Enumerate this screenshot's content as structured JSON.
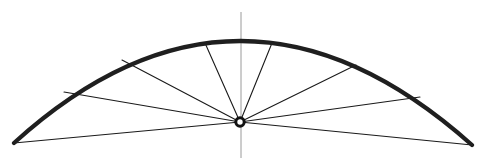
{
  "figure": {
    "canvas": {
      "width": 487,
      "height": 162,
      "background": "#ffffff"
    },
    "colors": {
      "arc": "#1f1f1f",
      "spoke": "#1a1a1a",
      "axis": "#9a9a9a",
      "hub_ring": "#111111",
      "hub_core": "#ffffff",
      "background": "#ffffff"
    },
    "strokes": {
      "arc_width": 4.2,
      "spoke_width": 1.1,
      "axis_width": 1.0,
      "hub_ring_width": 3.0
    }
  },
  "chart_data": {
    "type": "scatter",
    "xlabel": "",
    "ylabel": "",
    "xlim": [
      0,
      487
    ],
    "ylim": [
      162,
      0
    ],
    "grid": false,
    "legend": "none",
    "hub": {
      "label": "center hub",
      "x": 240,
      "y": 122,
      "outer_radius": 5.2,
      "inner_radius": 2.1
    },
    "axis_line": {
      "label": "vertical center axis",
      "x": 241,
      "y_top": 12,
      "y_bottom": 158
    },
    "arc": {
      "label": "arch extrados curve",
      "left_end": {
        "x": 14,
        "y": 143
      },
      "apex": {
        "x": 240,
        "y": 41
      },
      "right_end": {
        "x": 472,
        "y": 145
      },
      "path": "M 14 143 Q 240 -62 472 145"
    },
    "spokes": [
      {
        "label": "spoke-1-left-springing",
        "x1": 240,
        "y1": 122,
        "x2": 14,
        "y2": 143
      },
      {
        "label": "spoke-2-lower-left",
        "x1": 240,
        "y1": 122,
        "x2": 64,
        "y2": 92
      },
      {
        "label": "spoke-3-upper-left",
        "x1": 240,
        "y1": 122,
        "x2": 122,
        "y2": 60
      },
      {
        "label": "spoke-4-left-of-crown",
        "x1": 240,
        "y1": 122,
        "x2": 205,
        "y2": 43
      },
      {
        "label": "spoke-5-right-of-crown",
        "x1": 240,
        "y1": 122,
        "x2": 272,
        "y2": 43
      },
      {
        "label": "spoke-6-upper-right",
        "x1": 240,
        "y1": 122,
        "x2": 356,
        "y2": 65
      },
      {
        "label": "spoke-7-lower-right",
        "x1": 240,
        "y1": 122,
        "x2": 420,
        "y2": 97
      },
      {
        "label": "spoke-8-right-springing",
        "x1": 240,
        "y1": 122,
        "x2": 472,
        "y2": 145
      }
    ],
    "counts": {
      "spokes": 8,
      "arcs": 1,
      "axes": 1,
      "hubs": 1
    }
  }
}
